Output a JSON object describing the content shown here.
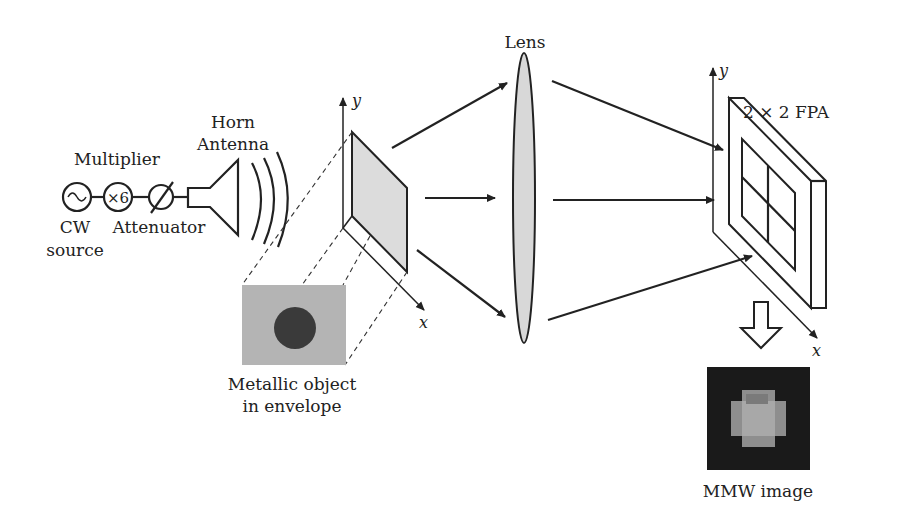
{
  "diagram": {
    "labels": {
      "source_line1": "CW",
      "source_line2": "source",
      "multiplier": "Multiplier",
      "multiplier_symbol": "×6",
      "attenuator": "Attenuator",
      "horn_line1": "Horn",
      "horn_line2": "Antenna",
      "object_line1": "Metallic object",
      "object_line2": "in envelope",
      "lens": "Lens",
      "fpa": "2 × 2 FPA",
      "mmw_image": "MMW image",
      "axis_y": "y",
      "axis_x": "x"
    },
    "colors": {
      "line": "#222222",
      "plane_fill": "#dcdcdc",
      "lens_fill": "#d8d8d8",
      "photo_bg": "#b4b4b4",
      "photo_disc": "#3a3a3a",
      "mmw_bg": "#1a1a1a"
    }
  }
}
